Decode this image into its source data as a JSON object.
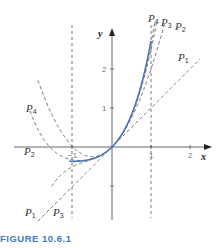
{
  "figure": {
    "caption": "FIGURE 10.6.1"
  },
  "axes": {
    "x_label": "x",
    "y_label": "y",
    "x_ticks": [
      {
        "value": -1,
        "label": "−1"
      },
      {
        "value": 1,
        "label": "1"
      },
      {
        "value": 2,
        "label": "2"
      }
    ],
    "y_ticks": [
      {
        "value": 1,
        "label": "1"
      },
      {
        "value": 2,
        "label": "2"
      },
      {
        "value": -1,
        "label": ""
      }
    ]
  },
  "colors": {
    "function_curve": "#4a78b8",
    "polynomials": "#666666",
    "axes": "#555555",
    "caption": "#3d78c0"
  },
  "chart_data": {
    "type": "line",
    "title": "FIGURE 10.6.1",
    "xlabel": "x",
    "ylabel": "y",
    "xlim": [
      -2.9,
      2.5
    ],
    "ylim": [
      -1.8,
      3.0
    ],
    "grid": false,
    "function": "y = x e^x",
    "series": [
      {
        "name": "f(x)",
        "style": "solid",
        "formula": "x*exp(x)",
        "domain": [
          -1.1,
          1.0
        ]
      },
      {
        "name": "P1",
        "style": "dashed",
        "formula": "x",
        "domain": [
          -1.9,
          2.25
        ]
      },
      {
        "name": "P2",
        "style": "dashed",
        "formula": "x + x^2",
        "domain": [
          -1.9,
          1.6
        ]
      },
      {
        "name": "P3",
        "style": "dashed",
        "formula": "x + x^2 + x^3/2",
        "domain": [
          -1.55,
          1.3
        ]
      },
      {
        "name": "P4",
        "style": "dashed",
        "formula": "x + x^2 + x^3/2 + x^4/6",
        "domain": [
          -2.1,
          1.2
        ]
      }
    ],
    "annotations": [
      {
        "text": "P4",
        "x": 1.0,
        "y": 3.05
      },
      {
        "text": "P3",
        "x": 1.25,
        "y": 3.0
      },
      {
        "text": "P2",
        "x": 1.55,
        "y": 2.85
      },
      {
        "text": "P1",
        "x": 1.85,
        "y": 2.0
      },
      {
        "text": "P4",
        "x": -2.1,
        "y": 1.0
      },
      {
        "text": "P2",
        "x": -2.2,
        "y": -0.1
      },
      {
        "text": "P1",
        "x": -2.0,
        "y": -1.7
      },
      {
        "text": "P3",
        "x": -1.35,
        "y": -1.7
      }
    ],
    "vertical_guides": [
      -1,
      1
    ]
  },
  "labels": {
    "p1_right": {
      "main": "P",
      "sub": "1"
    },
    "p2_right": {
      "main": "P",
      "sub": "2"
    },
    "p3_right": {
      "main": "P",
      "sub": "3"
    },
    "p4_right": {
      "main": "P",
      "sub": "4"
    },
    "p4_left": {
      "main": "P",
      "sub": "4"
    },
    "p2_left": {
      "main": "P",
      "sub": "2"
    },
    "p1_bottom": {
      "main": "P",
      "sub": "1"
    },
    "p3_bottom": {
      "main": "P",
      "sub": "3"
    }
  }
}
